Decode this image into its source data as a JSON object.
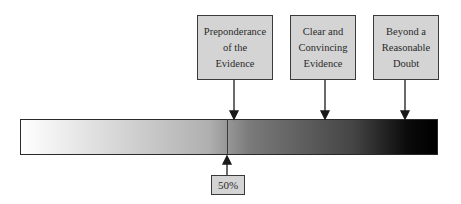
{
  "diagram": {
    "labels": [
      {
        "id": "preponderance",
        "text": "Preponderance\nof the\nEvidence"
      },
      {
        "id": "clear-convincing",
        "text": "Clear and\nConvincing\nEvidence"
      },
      {
        "id": "beyond-reasonable-doubt",
        "text": "Beyond a\nReasonable\nDoubt"
      }
    ],
    "midpoint_label": "50%",
    "scale": {
      "start": "0%",
      "end": "100%",
      "gradient": "white to black"
    },
    "colors": {
      "box_fill": "#d4d4d4",
      "border": "#3a3a3a",
      "bar_start": "#ffffff",
      "bar_end": "#000000"
    }
  }
}
